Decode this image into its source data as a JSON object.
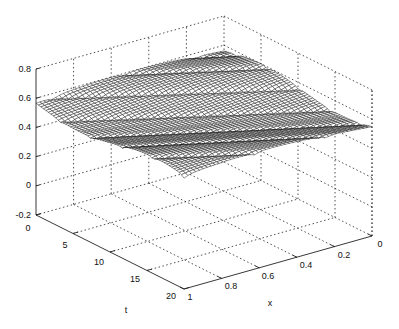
{
  "chart_data": {
    "type": "surface",
    "title": "",
    "xlabel": "x",
    "ylabel": "t",
    "zlabel": "",
    "x_range": [
      0,
      1
    ],
    "t_range": [
      0,
      20
    ],
    "z_range": [
      -0.2,
      0.8
    ],
    "x_ticks": [
      "0",
      "0.2",
      "0.4",
      "0.6",
      "0.8",
      "1"
    ],
    "t_ticks": [
      "0",
      "5",
      "10",
      "15",
      "20"
    ],
    "z_ticks": [
      "-0.2",
      "0",
      "0.2",
      "0.4",
      "0.6",
      "0.8"
    ],
    "grid": true,
    "style": "mesh",
    "plateau_height": 0.6,
    "baseline": 0.0
  },
  "axes": {
    "x_label": "x",
    "t_label": "t",
    "x_tick_labels": [
      "0",
      "0.2",
      "0.4",
      "0.6",
      "0.8",
      "1"
    ],
    "t_tick_labels": [
      "0",
      "5",
      "10",
      "15",
      "20"
    ],
    "z_tick_labels": [
      "0.8",
      "0.6",
      "0.4",
      "0.2",
      "0",
      "-0.2"
    ]
  }
}
